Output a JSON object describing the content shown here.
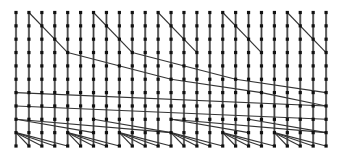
{
  "diagram": {
    "type": "parallel-prefix-network",
    "columns": 25,
    "rows": 11,
    "x0": 16,
    "dx": 12.92,
    "y0": 12.5,
    "dy": 13.35,
    "colors": {
      "column": "#8a8a8a",
      "edge": "#333333",
      "node": "#111111",
      "background": "#ffffff"
    },
    "edges": [
      [
        1,
        0,
        4,
        3
      ],
      [
        6,
        0,
        9,
        3
      ],
      [
        11,
        0,
        14,
        3
      ],
      [
        16,
        0,
        19,
        3
      ],
      [
        21,
        0,
        24,
        3
      ],
      [
        4,
        3,
        12,
        5
      ],
      [
        12,
        5,
        19,
        6
      ],
      [
        19,
        6,
        24,
        7
      ],
      [
        9,
        3,
        17,
        5
      ],
      [
        17,
        5,
        24,
        6
      ],
      [
        0,
        6,
        24,
        7
      ],
      [
        0,
        7,
        24,
        8
      ],
      [
        0,
        8,
        12,
        9
      ],
      [
        12,
        8,
        24,
        9
      ],
      [
        0,
        9,
        4,
        10
      ],
      [
        0,
        9,
        3,
        10
      ],
      [
        0,
        9,
        2,
        10
      ],
      [
        0,
        9,
        1,
        10
      ],
      [
        4,
        9,
        8,
        10
      ],
      [
        4,
        9,
        7,
        10
      ],
      [
        4,
        9,
        6,
        10
      ],
      [
        4,
        9,
        5,
        10
      ],
      [
        8,
        9,
        12,
        10
      ],
      [
        8,
        9,
        11,
        10
      ],
      [
        8,
        9,
        10,
        10
      ],
      [
        8,
        9,
        9,
        10
      ],
      [
        12,
        9,
        16,
        10
      ],
      [
        12,
        9,
        15,
        10
      ],
      [
        12,
        9,
        14,
        10
      ],
      [
        12,
        9,
        13,
        10
      ],
      [
        16,
        9,
        20,
        10
      ],
      [
        16,
        9,
        19,
        10
      ],
      [
        16,
        9,
        18,
        10
      ],
      [
        16,
        9,
        17,
        10
      ],
      [
        20,
        9,
        24,
        10
      ],
      [
        20,
        9,
        23,
        10
      ],
      [
        20,
        9,
        22,
        10
      ],
      [
        20,
        9,
        21,
        10
      ],
      [
        0,
        8,
        6,
        9
      ],
      [
        6,
        8,
        12,
        9
      ],
      [
        12,
        8,
        18,
        9
      ],
      [
        18,
        8,
        24,
        9
      ]
    ]
  }
}
